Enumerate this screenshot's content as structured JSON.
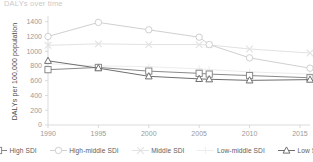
{
  "chart_title": "DALYs over time",
  "axis": {
    "y_label": "DALYs per 100,000 population",
    "y_ticks": [
      0,
      200,
      400,
      600,
      800,
      1000,
      1200,
      1400
    ],
    "x_ticks": [
      1990,
      1995,
      2000,
      2005,
      2010,
      2015
    ]
  },
  "legend": {
    "items": [
      {
        "label": "High SDI",
        "marker": "square",
        "color": "#8a8a8a"
      },
      {
        "label": "High-middle SDI",
        "marker": "circle",
        "color": "#d0d0d0"
      },
      {
        "label": "Middle SDI",
        "marker": "cross-x",
        "color": "#e2e2e2"
      },
      {
        "label": "Low-middle SDI",
        "marker": "plus",
        "color": "#ededed"
      },
      {
        "label": "Low SDI",
        "marker": "triangle",
        "color": "#6f6f6f"
      }
    ]
  },
  "chart_data": {
    "type": "line",
    "title": "DALYs over time",
    "xlabel": "",
    "ylabel": "DALYs per 100,000 population",
    "xlim": [
      1990,
      2016
    ],
    "ylim": [
      0,
      1450
    ],
    "grid": false,
    "legend_position": "bottom",
    "x": [
      1990,
      1995,
      2000,
      2005,
      2006,
      2010,
      2016
    ],
    "series": [
      {
        "name": "High SDI",
        "marker": "square",
        "color": "#8a8a8a",
        "values": [
          750,
          780,
          730,
          700,
          690,
          670,
          640
        ]
      },
      {
        "name": "High-middle SDI",
        "marker": "circle",
        "color": "#d0d0d0",
        "values": [
          1200,
          1390,
          1290,
          1190,
          1090,
          910,
          770
        ]
      },
      {
        "name": "Middle SDI",
        "marker": "cross-x",
        "color": "#e2e2e2",
        "values": [
          1080,
          1100,
          1090,
          1090,
          1085,
          1030,
          975
        ]
      },
      {
        "name": "Low-middle SDI",
        "marker": "plus",
        "color": "#ededed",
        "values": [
          830,
          800,
          790,
          760,
          750,
          720,
          690
        ]
      },
      {
        "name": "Low SDI",
        "marker": "triangle",
        "color": "#6f6f6f",
        "values": [
          870,
          770,
          660,
          625,
          620,
          605,
          615
        ]
      }
    ]
  }
}
